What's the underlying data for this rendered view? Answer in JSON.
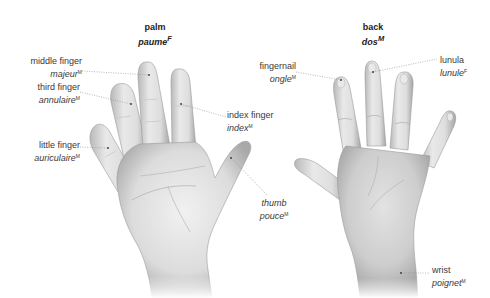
{
  "figures": {
    "palm": {
      "title_en": "palm",
      "title_fr": "paume",
      "title_gender": "F",
      "labels": [
        {
          "id": "middle_finger",
          "en": "middle finger",
          "fr": "majeur",
          "gender": "M"
        },
        {
          "id": "third_finger",
          "en": "third finger",
          "fr": "annulaire",
          "gender": "M"
        },
        {
          "id": "little_finger",
          "en": "little finger",
          "fr": "auriculaire",
          "gender": "M"
        },
        {
          "id": "index_finger",
          "en": "index finger",
          "fr": "index",
          "gender": "M"
        },
        {
          "id": "thumb",
          "en": "thumb",
          "fr": "pouce",
          "gender": "M"
        }
      ]
    },
    "back": {
      "title_en": "back",
      "title_fr": "dos",
      "title_gender": "M",
      "labels": [
        {
          "id": "fingernail",
          "en": "fingernail",
          "fr": "ongle",
          "gender": "M"
        },
        {
          "id": "lunula",
          "en": "lunula",
          "fr": "lunule",
          "gender": "F"
        },
        {
          "id": "wrist",
          "en": "wrist",
          "fr": "poignet",
          "gender": "M"
        }
      ]
    }
  },
  "colors": {
    "leader_line": "#888888",
    "skin_light": "#eeeeee",
    "skin_mid": "#cfcfcf",
    "skin_dark": "#a8a8a8",
    "text": "#3a3a3a"
  }
}
